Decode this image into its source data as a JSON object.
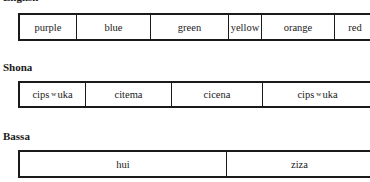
{
  "sections": [
    {
      "language": "English",
      "cells": [
        "purple",
        "blue",
        "green",
        "yellow",
        "orange",
        "red"
      ]
    },
    {
      "language": "Shona",
      "cells": [
        "cipsʷuka",
        "citema",
        "cicena",
        "cipsʷuka"
      ],
      "cells_parts": [
        {
          "pre": "cips",
          "sup": "w",
          "post": "uka"
        },
        {
          "pre": "citema",
          "sup": "",
          "post": ""
        },
        {
          "pre": "cicena",
          "sup": "",
          "post": ""
        },
        {
          "pre": "cips",
          "sup": "w",
          "post": "uka"
        }
      ]
    },
    {
      "language": "Bassa",
      "cells": [
        "hui",
        "ziza"
      ]
    }
  ]
}
